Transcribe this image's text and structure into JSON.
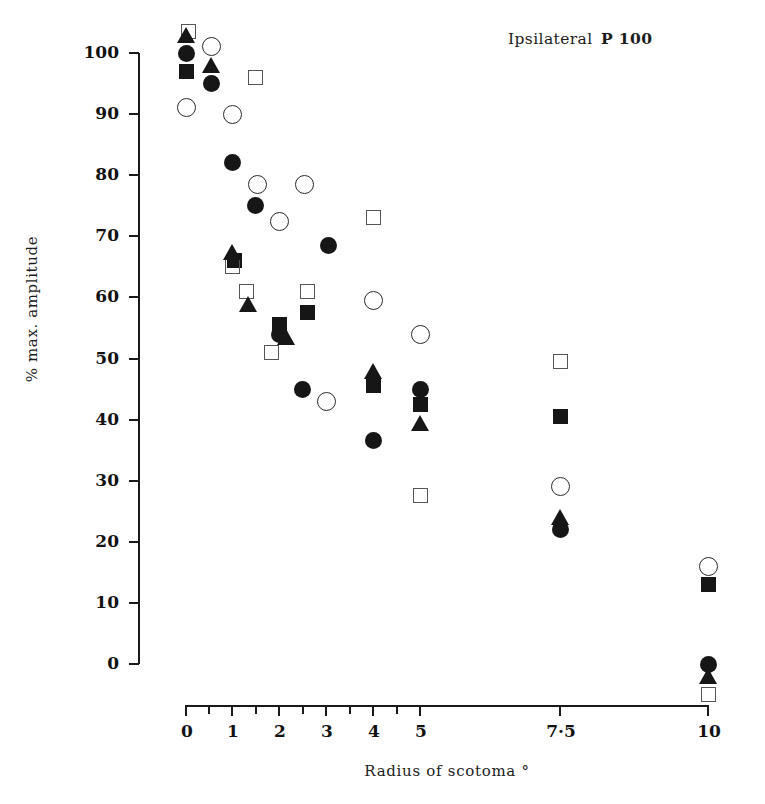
{
  "chart_data": {
    "type": "scatter",
    "title": "Ipsilateral P 100",
    "title_prefix": "Ipsilateral",
    "title_suffix": "P 100",
    "xlabel": "Radius of scotoma °",
    "ylabel": "% max. amplitude",
    "grid": false,
    "legend": "none",
    "ylim": [
      -8,
      104
    ],
    "y_ticks": [
      100,
      90,
      80,
      70,
      60,
      50,
      40,
      30,
      20,
      10,
      0
    ],
    "y_tick_labels": [
      "100",
      "90",
      "80",
      "70",
      "60",
      "50",
      "40",
      "30",
      "20",
      "10",
      "0"
    ],
    "x_tick_labels": [
      "0",
      "1",
      "2",
      "3",
      "4",
      "5",
      "7·5",
      "10"
    ],
    "x_tick_values": [
      0,
      1,
      2,
      3,
      4,
      5,
      7.5,
      10
    ],
    "x_axis_note": "non-linear ordinal axis with additional unlabeled minor ticks between labelled values",
    "x_minor_ticks": [
      0.5,
      1.5,
      2.5,
      3.5,
      4.5
    ],
    "series": [
      {
        "name": "subject-1",
        "marker": "filled-circle",
        "points": [
          {
            "x": 0.0,
            "y": 100.0
          },
          {
            "x": 0.55,
            "y": 95.0
          },
          {
            "x": 1.0,
            "y": 82.0
          },
          {
            "x": 1.5,
            "y": 75.0
          },
          {
            "x": 2.0,
            "y": 54.0
          },
          {
            "x": 2.5,
            "y": 45.0
          },
          {
            "x": 3.05,
            "y": 68.5
          },
          {
            "x": 4.0,
            "y": 36.5
          },
          {
            "x": 5.0,
            "y": 45.0
          },
          {
            "x": 7.5,
            "y": 22.0
          },
          {
            "x": 10.0,
            "y": 0.0
          }
        ]
      },
      {
        "name": "subject-2",
        "marker": "open-circle",
        "points": [
          {
            "x": 0.0,
            "y": 91.0
          },
          {
            "x": 0.55,
            "y": 101.0
          },
          {
            "x": 1.0,
            "y": 90.0
          },
          {
            "x": 1.55,
            "y": 78.5
          },
          {
            "x": 2.0,
            "y": 72.5
          },
          {
            "x": 2.55,
            "y": 78.5
          },
          {
            "x": 3.0,
            "y": 43.0
          },
          {
            "x": 4.0,
            "y": 59.5
          },
          {
            "x": 5.0,
            "y": 54.0
          },
          {
            "x": 7.5,
            "y": 29.0
          },
          {
            "x": 10.0,
            "y": 16.0
          }
        ]
      },
      {
        "name": "subject-3",
        "marker": "filled-square",
        "points": [
          {
            "x": 0.0,
            "y": 97.0
          },
          {
            "x": 1.05,
            "y": 66.0
          },
          {
            "x": 2.0,
            "y": 55.5
          },
          {
            "x": 2.6,
            "y": 57.5
          },
          {
            "x": 4.0,
            "y": 45.5
          },
          {
            "x": 5.0,
            "y": 42.5
          },
          {
            "x": 7.5,
            "y": 40.5
          },
          {
            "x": 10.0,
            "y": 13.0
          }
        ]
      },
      {
        "name": "subject-4",
        "marker": "open-square",
        "points": [
          {
            "x": 0.05,
            "y": 103.5
          },
          {
            "x": 1.5,
            "y": 96.0
          },
          {
            "x": 1.0,
            "y": 65.0
          },
          {
            "x": 1.3,
            "y": 61.0
          },
          {
            "x": 1.85,
            "y": 51.0
          },
          {
            "x": 2.6,
            "y": 61.0
          },
          {
            "x": 4.0,
            "y": 73.0
          },
          {
            "x": 5.0,
            "y": 27.5
          },
          {
            "x": 7.5,
            "y": 49.5
          },
          {
            "x": 10.0,
            "y": -5.0
          }
        ]
      },
      {
        "name": "subject-5",
        "marker": "filled-triangle",
        "points": [
          {
            "x": 0.0,
            "y": 103.0
          },
          {
            "x": 0.55,
            "y": 98.0
          },
          {
            "x": 1.0,
            "y": 67.5
          },
          {
            "x": 1.35,
            "y": 59.0
          },
          {
            "x": 2.15,
            "y": 53.5
          },
          {
            "x": 4.0,
            "y": 48.0
          },
          {
            "x": 5.0,
            "y": 39.5
          },
          {
            "x": 7.5,
            "y": 24.0
          },
          {
            "x": 10.0,
            "y": -2.0
          }
        ]
      }
    ],
    "marker_legend": [
      {
        "key": "filled-circle",
        "label": "filled circle"
      },
      {
        "key": "open-circle",
        "label": "open circle"
      },
      {
        "key": "filled-square",
        "label": "filled square"
      },
      {
        "key": "open-square",
        "label": "open square"
      },
      {
        "key": "filled-triangle",
        "label": "filled triangle"
      }
    ]
  }
}
